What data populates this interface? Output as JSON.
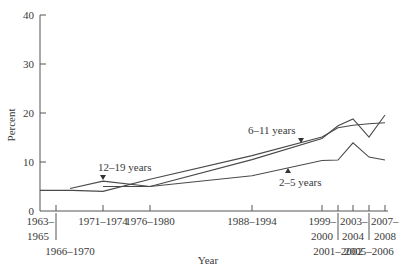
{
  "chart_data": {
    "type": "line",
    "title": "",
    "xlabel": "Year",
    "ylabel": "Percent",
    "ylim": [
      0,
      40
    ],
    "yticks": [
      0,
      10,
      20,
      30,
      40
    ],
    "grid": false,
    "legend": "inline labels with arrow markers",
    "categories": [
      "1963–1965",
      "1966–1970",
      "1971–1974",
      "1976–1980",
      "1988–1994",
      "1999–2000",
      "2001–2002",
      "2003–2004",
      "2005–2006",
      "2007–2008"
    ],
    "series": [
      {
        "name": "2–5 years",
        "values": [
          null,
          null,
          5.0,
          5.0,
          7.2,
          10.3,
          10.4,
          13.9,
          11.0,
          10.4
        ]
      },
      {
        "name": "6–11 years",
        "values": [
          4.2,
          4.2,
          4.0,
          6.5,
          11.3,
          15.1,
          17.0,
          17.5,
          17.8,
          18.0
        ]
      },
      {
        "name": "12–19 years",
        "values": [
          null,
          4.6,
          6.1,
          5.0,
          10.5,
          14.8,
          17.4,
          18.8,
          15.1,
          19.6
        ]
      }
    ],
    "series_points_px_note": "values estimated from pixel positions against y-axis ticks"
  },
  "axis": {
    "y_title": "Percent",
    "x_title": "Year",
    "y_ticks": [
      "0",
      "10",
      "20",
      "30",
      "40"
    ],
    "x_labels_row1": [
      "1963–",
      "1971–1974",
      "1976–1980",
      "1988–1994",
      "1999–",
      "2003–",
      "2007–"
    ],
    "x_labels_row2": [
      "1965",
      "2000",
      "2004",
      "2008"
    ],
    "x_labels_row3": [
      "1966–1970",
      "2001–2002",
      "2005–2006"
    ]
  },
  "labels": {
    "teen": "12–19 years",
    "child": "6–11 years",
    "preschool": "2–5 years"
  }
}
